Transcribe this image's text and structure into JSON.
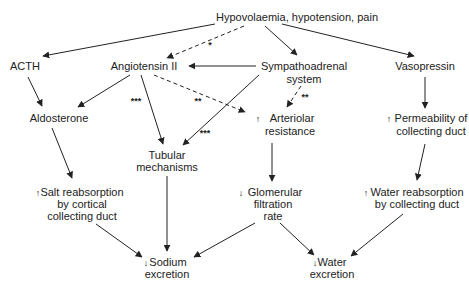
{
  "diagram": {
    "nodes": {
      "trigger": {
        "lines": [
          "Hypovolaemia, hypotension, pain"
        ],
        "prefix": ""
      },
      "acth": {
        "lines": [
          "ACTH"
        ],
        "prefix": ""
      },
      "angiotensin": {
        "lines": [
          "Angiotensin II"
        ],
        "prefix": ""
      },
      "sympathoadrenal": {
        "lines": [
          "Sympathoadrenal",
          "system"
        ],
        "prefix": ""
      },
      "vasopressin": {
        "lines": [
          "Vasopressin"
        ],
        "prefix": ""
      },
      "aldosterone": {
        "lines": [
          "Aldosterone"
        ],
        "prefix": ""
      },
      "arteriolar": {
        "lines": [
          "Arteriolar",
          "resistance"
        ],
        "prefix": "up"
      },
      "permeability": {
        "lines": [
          "Permeability of",
          "collecting duct"
        ],
        "prefix": "up"
      },
      "tubular": {
        "lines": [
          "Tubular",
          "mechanisms"
        ],
        "prefix": ""
      },
      "salt": {
        "lines": [
          "Salt reabsorption",
          "by cortical",
          "collecting duct"
        ],
        "prefix": "up"
      },
      "gfr": {
        "lines": [
          "Glomerular",
          "filtration",
          "rate"
        ],
        "prefix": "down"
      },
      "water_reabs": {
        "lines": [
          "Water reabsorption",
          "by collecting duct"
        ],
        "prefix": "up"
      },
      "sodium": {
        "lines": [
          "Sodium",
          "excretion"
        ],
        "prefix": "down"
      },
      "water_exc": {
        "lines": [
          "Water",
          "excretion"
        ],
        "prefix": "down"
      }
    },
    "edge_labels": {
      "trigger_angiotensin": "*",
      "angiotensin_tubular": "***",
      "angiotensin_arteriolar": "**",
      "sympathoadrenal_arteriolar": "**",
      "sympathoadrenal_tubular": "***"
    },
    "edges": [
      {
        "from": "trigger",
        "to": "acth",
        "style": "solid"
      },
      {
        "from": "trigger",
        "to": "angiotensin",
        "style": "dashed",
        "label": "*"
      },
      {
        "from": "trigger",
        "to": "sympathoadrenal",
        "style": "solid"
      },
      {
        "from": "trigger",
        "to": "vasopressin",
        "style": "solid"
      },
      {
        "from": "sympathoadrenal",
        "to": "angiotensin",
        "style": "solid"
      },
      {
        "from": "acth",
        "to": "aldosterone",
        "style": "solid"
      },
      {
        "from": "angiotensin",
        "to": "aldosterone",
        "style": "solid"
      },
      {
        "from": "angiotensin",
        "to": "tubular",
        "style": "solid",
        "label": "***"
      },
      {
        "from": "angiotensin",
        "to": "arteriolar",
        "style": "dashed",
        "label": "**"
      },
      {
        "from": "sympathoadrenal",
        "to": "arteriolar",
        "style": "dashed",
        "label": "**"
      },
      {
        "from": "sympathoadrenal",
        "to": "tubular",
        "style": "solid",
        "label": "***"
      },
      {
        "from": "vasopressin",
        "to": "permeability",
        "style": "solid"
      },
      {
        "from": "aldosterone",
        "to": "salt",
        "style": "solid"
      },
      {
        "from": "arteriolar",
        "to": "gfr",
        "style": "solid"
      },
      {
        "from": "permeability",
        "to": "water_reabs",
        "style": "solid"
      },
      {
        "from": "salt",
        "to": "sodium",
        "style": "solid"
      },
      {
        "from": "tubular",
        "to": "sodium",
        "style": "solid"
      },
      {
        "from": "gfr",
        "to": "sodium",
        "style": "solid"
      },
      {
        "from": "gfr",
        "to": "water_exc",
        "style": "solid"
      },
      {
        "from": "water_reabs",
        "to": "water_exc",
        "style": "solid"
      }
    ]
  }
}
